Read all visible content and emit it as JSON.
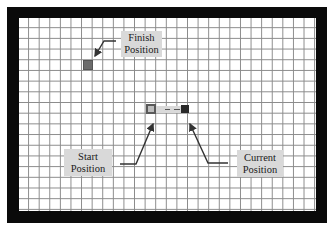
{
  "diagram": {
    "type": "grid-path-diagram",
    "grid": {
      "columns": 28,
      "rows": 18
    },
    "labels": {
      "finish": {
        "line1": "Finish",
        "line2": "Position"
      },
      "start": {
        "line1": "Start",
        "line2": "Position"
      },
      "current": {
        "line1": "Current",
        "line2": "Position"
      }
    },
    "colors": {
      "border": "#0a0a0a",
      "grid_line": "#8a8a8a",
      "label_bg": "#d9d9d9",
      "finish_cell": "#6b6b6b",
      "start_cell": "#bdbdbd",
      "current_cell": "#2a2a2a",
      "trail": "#d9d9d9",
      "arrow": "#333333"
    }
  }
}
